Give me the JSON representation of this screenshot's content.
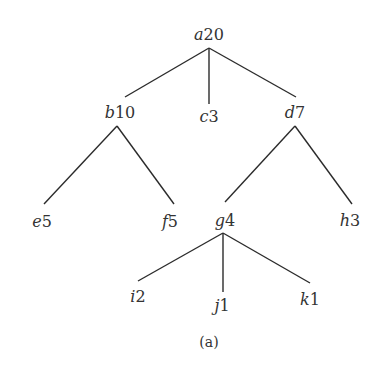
{
  "diagram": {
    "type": "tree",
    "caption": "(a)",
    "nodes": [
      {
        "id": "a",
        "letter": "a",
        "value": "20"
      },
      {
        "id": "b",
        "letter": "b",
        "value": "10"
      },
      {
        "id": "c",
        "letter": "c",
        "value": "3"
      },
      {
        "id": "d",
        "letter": "d",
        "value": "7"
      },
      {
        "id": "e",
        "letter": "e",
        "value": "5"
      },
      {
        "id": "f",
        "letter": "f",
        "value": "5"
      },
      {
        "id": "g",
        "letter": "g",
        "value": "4"
      },
      {
        "id": "h",
        "letter": "h",
        "value": "3"
      },
      {
        "id": "i",
        "letter": "i",
        "value": "2"
      },
      {
        "id": "j",
        "letter": "j",
        "value": "1"
      },
      {
        "id": "k",
        "letter": "k",
        "value": "1"
      }
    ],
    "edges": [
      [
        "a",
        "b"
      ],
      [
        "a",
        "c"
      ],
      [
        "a",
        "d"
      ],
      [
        "b",
        "e"
      ],
      [
        "b",
        "f"
      ],
      [
        "d",
        "g"
      ],
      [
        "d",
        "h"
      ],
      [
        "g",
        "i"
      ],
      [
        "g",
        "j"
      ],
      [
        "g",
        "k"
      ]
    ]
  }
}
